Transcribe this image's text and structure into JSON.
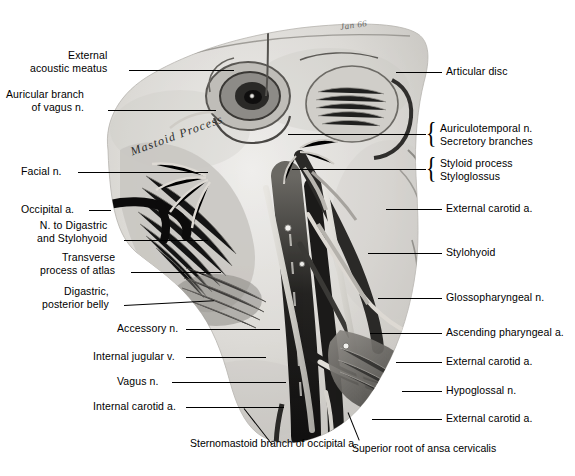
{
  "figure": {
    "title_overlay": "Mastoid Process",
    "signature": "Jan 66",
    "type": "anatomical-dissection-photograph",
    "palette": {
      "background": "#ffffff",
      "ink": "#000000",
      "tissue_light": "#d8d6d2",
      "tissue_mid": "#9a9894",
      "tissue_dark": "#3a3836",
      "tissue_darkest": "#141312"
    }
  },
  "labels_left": [
    {
      "line1": "External",
      "line2": "acoustic meatus"
    },
    {
      "line1": "Auricular branch",
      "line2": "of vagus n."
    },
    {
      "line1": "Facial n.",
      "line2": ""
    },
    {
      "line1": "Occipital a.",
      "line2": ""
    },
    {
      "line1": "N. to Digastric",
      "line2": "and Stylohyoid"
    },
    {
      "line1": "Transverse",
      "line2": "process of atlas"
    },
    {
      "line1": "Digastric,",
      "line2": "posterior belly"
    },
    {
      "line1": "Accessory n.",
      "line2": ""
    },
    {
      "line1": "Internal jugular v.",
      "line2": ""
    },
    {
      "line1": "Vagus n.",
      "line2": ""
    },
    {
      "line1": "Internal carotid a.",
      "line2": ""
    }
  ],
  "labels_right": [
    {
      "line1": "Articular disc",
      "line2": "",
      "braced": false
    },
    {
      "line1": "Auriculotemporal n.",
      "line2": "Secretory branches",
      "braced": true
    },
    {
      "line1": "Styloid process",
      "line2": "Styloglossus",
      "braced": true
    },
    {
      "line1": "External carotid a.",
      "line2": "",
      "braced": false
    },
    {
      "line1": "Stylohyoid",
      "line2": "",
      "braced": false
    },
    {
      "line1": "Glossopharyngeal n.",
      "line2": "",
      "braced": false
    },
    {
      "line1": "Ascending pharyngeal a.",
      "line2": "",
      "braced": false
    },
    {
      "line1": "External carotid a.",
      "line2": "",
      "braced": false
    },
    {
      "line1": "Hypoglossal n.",
      "line2": "",
      "braced": false
    },
    {
      "line1": "External carotid a.",
      "line2": "",
      "braced": false
    }
  ],
  "captions_bottom": [
    {
      "line1": "Sternomastoid branch of",
      "line2": "occipital a."
    },
    {
      "line1": "Superior root of ansa cervicalis",
      "line2": ""
    }
  ]
}
